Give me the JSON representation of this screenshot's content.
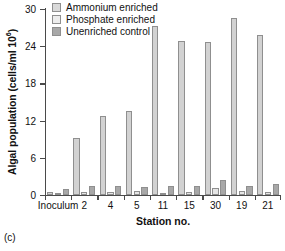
{
  "caption": "(c)",
  "legend": {
    "position": "top-left-inside",
    "entries": [
      {
        "label": "Ammonium enriched",
        "color": "#d9d9d9",
        "series_index": 0
      },
      {
        "label": "Phosphate enriched",
        "color": "#ededed",
        "series_index": 1
      },
      {
        "label": "Unenriched control",
        "color": "#a8a8a8",
        "series_index": 2
      }
    ]
  },
  "axes": {
    "ylabel_main": "Algal population (cells/ml  10",
    "ylabel_sup": "6",
    "ylabel_tail": ")",
    "xlabel": "Station no.",
    "yticks": [
      "30",
      "24",
      "18",
      "12",
      "6",
      "0"
    ]
  },
  "chart_data": {
    "type": "bar",
    "title": "",
    "xlabel": "Station no.",
    "ylabel": "Algal population (cells/ml 10^6)",
    "ylim": [
      0,
      30
    ],
    "yticks": [
      0,
      6,
      12,
      18,
      24,
      30
    ],
    "grid": false,
    "legend_position": "upper left",
    "categories": [
      "Inoculum",
      "2",
      "4",
      "5",
      "11",
      "15",
      "30",
      "19",
      "21"
    ],
    "series": [
      {
        "name": "Ammonium enriched",
        "color": "#d2d2d2",
        "values": [
          0.5,
          9.2,
          12.7,
          13.5,
          27.3,
          24.8,
          24.7,
          28.6,
          25.8
        ]
      },
      {
        "name": "Phosphate enriched",
        "color": "#e6e6e6",
        "values": [
          0.3,
          0.5,
          0.5,
          0.6,
          0.4,
          0.5,
          1.1,
          0.7,
          0.5
        ]
      },
      {
        "name": "Unenriched control",
        "color": "#a8a8a8",
        "values": [
          1.0,
          1.4,
          1.5,
          1.3,
          1.5,
          1.5,
          2.4,
          1.4,
          1.8
        ]
      }
    ]
  }
}
